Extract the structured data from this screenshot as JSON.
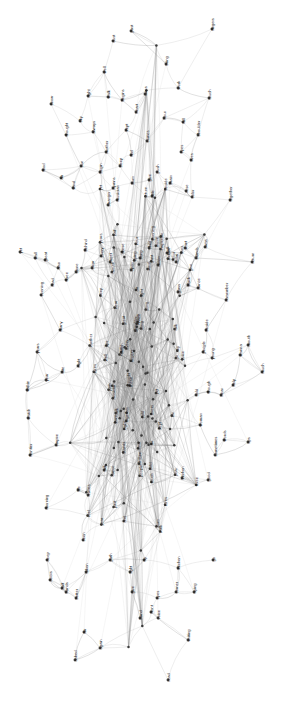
{
  "figure": {
    "background_color": "#ffffff",
    "node_color": "#3a3a3a",
    "edge_color": "#9a9a9a",
    "label_color": "#111111",
    "label_rotation_degrees": -90
  },
  "chart_data": {
    "type": "scatter",
    "subtitle": "",
    "xlabel": "",
    "ylabel": "",
    "xlim": [
      0,
      287
    ],
    "ylim": [
      0,
      716
    ],
    "grid": false,
    "legend": "none",
    "layout": "force-directed",
    "node_count": 261,
    "edge_count": 742,
    "nodes": [
      {
        "label": "past",
        "x": 131,
        "y": 31
      },
      {
        "label": "dust",
        "x": 113,
        "y": 41
      },
      {
        "label": "fingers",
        "x": 212,
        "y": 29
      },
      {
        "label": "bring",
        "x": 166,
        "y": 64
      },
      {
        "label": "well",
        "x": 104,
        "y": 72
      },
      {
        "label": "right",
        "x": 88,
        "y": 96
      },
      {
        "label": "walk",
        "x": 108,
        "y": 97
      },
      {
        "label": "begins",
        "x": 122,
        "y": 100
      },
      {
        "label": "turns",
        "x": 145,
        "y": 94
      },
      {
        "label": "work",
        "x": 178,
        "y": 88
      },
      {
        "label": "touch",
        "x": 209,
        "y": 98
      },
      {
        "label": "snow",
        "x": 51,
        "y": 104
      },
      {
        "label": "sky",
        "x": 80,
        "y": 121
      },
      {
        "label": "heart",
        "x": 136,
        "y": 112
      },
      {
        "label": "hour",
        "x": 164,
        "y": 118
      },
      {
        "label": "fall",
        "x": 183,
        "y": 122
      },
      {
        "label": "thought",
        "x": 66,
        "y": 135
      },
      {
        "label": "always",
        "x": 93,
        "y": 132
      },
      {
        "label": "kept",
        "x": 126,
        "y": 130
      },
      {
        "label": "comes",
        "x": 147,
        "y": 141
      },
      {
        "label": "shoulder",
        "x": 198,
        "y": 135
      },
      {
        "label": "food",
        "x": 43,
        "y": 170
      },
      {
        "label": "air",
        "x": 61,
        "y": 178
      },
      {
        "label": "sun",
        "x": 81,
        "y": 166
      },
      {
        "label": "wind",
        "x": 73,
        "y": 188
      },
      {
        "label": "begin",
        "x": 100,
        "y": 172
      },
      {
        "label": "mother",
        "x": 106,
        "y": 152
      },
      {
        "label": "sleep",
        "x": 120,
        "y": 166
      },
      {
        "label": "feel",
        "x": 131,
        "y": 155
      },
      {
        "label": "eyes",
        "x": 181,
        "y": 152
      },
      {
        "label": "lives",
        "x": 191,
        "y": 160
      },
      {
        "label": "push",
        "x": 157,
        "y": 172
      },
      {
        "label": "burn",
        "x": 132,
        "y": 183
      },
      {
        "label": "hymns",
        "x": 113,
        "y": 188
      },
      {
        "label": "give",
        "x": 149,
        "y": 180
      },
      {
        "label": "brain",
        "x": 170,
        "y": 183
      },
      {
        "label": "together",
        "x": 230,
        "y": 200
      },
      {
        "label": "stranger",
        "x": 108,
        "y": 205
      },
      {
        "label": "musician",
        "x": 117,
        "y": 200
      },
      {
        "label": "little",
        "x": 152,
        "y": 196
      },
      {
        "label": "color",
        "x": 192,
        "y": 197
      },
      {
        "label": "rose",
        "x": 186,
        "y": 191
      },
      {
        "label": "yet",
        "x": 20,
        "y": 252
      },
      {
        "label": "wall",
        "x": 35,
        "y": 258
      },
      {
        "label": "great",
        "x": 45,
        "y": 260
      },
      {
        "label": "also",
        "x": 58,
        "y": 268
      },
      {
        "label": "evening",
        "x": 41,
        "y": 295
      },
      {
        "label": "read",
        "x": 52,
        "y": 285
      },
      {
        "label": "three",
        "x": 66,
        "y": 280
      },
      {
        "label": "stone",
        "x": 76,
        "y": 272
      },
      {
        "label": "behind",
        "x": 85,
        "y": 250
      },
      {
        "label": "clear",
        "x": 92,
        "y": 268
      },
      {
        "label": "every",
        "x": 101,
        "y": 256
      },
      {
        "label": "street",
        "x": 110,
        "y": 262
      },
      {
        "label": "these",
        "x": 122,
        "y": 252
      },
      {
        "label": "open",
        "x": 131,
        "y": 270
      },
      {
        "label": "song",
        "x": 140,
        "y": 258
      },
      {
        "label": "child",
        "x": 149,
        "y": 248
      },
      {
        "label": "moon",
        "x": 158,
        "y": 265
      },
      {
        "label": "dark",
        "x": 167,
        "y": 253
      },
      {
        "label": "room",
        "x": 176,
        "y": 262
      },
      {
        "label": "want",
        "x": 185,
        "y": 248
      },
      {
        "label": "stands",
        "x": 196,
        "y": 258
      },
      {
        "label": "arms",
        "x": 205,
        "y": 247
      },
      {
        "label": "return",
        "x": 252,
        "y": 262
      },
      {
        "label": "remember",
        "x": 226,
        "y": 300
      },
      {
        "label": "mouth",
        "x": 248,
        "y": 345
      },
      {
        "label": "many",
        "x": 60,
        "y": 330
      },
      {
        "label": "years",
        "x": 37,
        "y": 352
      },
      {
        "label": "within",
        "x": 27,
        "y": 390
      },
      {
        "label": "year",
        "x": 46,
        "y": 380
      },
      {
        "label": "late",
        "x": 62,
        "y": 372
      },
      {
        "label": "night",
        "x": 78,
        "y": 366
      },
      {
        "label": "black",
        "x": 188,
        "y": 285
      },
      {
        "label": "dance",
        "x": 198,
        "y": 288
      },
      {
        "label": "glass",
        "x": 178,
        "y": 292
      },
      {
        "label": "beside",
        "x": 206,
        "y": 330
      },
      {
        "label": "young",
        "x": 212,
        "y": 358
      },
      {
        "label": "people",
        "x": 203,
        "y": 352
      },
      {
        "label": "wanna",
        "x": 240,
        "y": 355
      },
      {
        "label": "much",
        "x": 262,
        "y": 372
      },
      {
        "label": "help",
        "x": 233,
        "y": 385
      },
      {
        "label": "hear",
        "x": 221,
        "y": 395
      },
      {
        "label": "though",
        "x": 208,
        "y": 392
      },
      {
        "label": "cold",
        "x": 196,
        "y": 395
      },
      {
        "label": "woman",
        "x": 200,
        "y": 425
      },
      {
        "label": "words",
        "x": 224,
        "y": 440
      },
      {
        "label": "sometimes",
        "x": 215,
        "y": 455
      },
      {
        "label": "lips",
        "x": 248,
        "y": 442
      },
      {
        "label": "good",
        "x": 208,
        "y": 480
      },
      {
        "label": "kitchen",
        "x": 182,
        "y": 478
      },
      {
        "label": "frontier",
        "x": 30,
        "y": 455
      },
      {
        "label": "empire",
        "x": 56,
        "y": 445
      },
      {
        "label": "morning",
        "x": 46,
        "y": 508
      },
      {
        "label": "deep",
        "x": 47,
        "y": 560
      },
      {
        "label": "seen",
        "x": 83,
        "y": 540
      },
      {
        "label": "life",
        "x": 78,
        "y": 490
      },
      {
        "label": "leaves",
        "x": 88,
        "y": 495
      },
      {
        "label": "talk",
        "x": 104,
        "y": 470
      },
      {
        "label": "watch",
        "x": 28,
        "y": 418
      },
      {
        "label": "path",
        "x": 110,
        "y": 560
      },
      {
        "label": "taken",
        "x": 86,
        "y": 572
      },
      {
        "label": "half",
        "x": 62,
        "y": 588
      },
      {
        "label": "better",
        "x": 76,
        "y": 598
      },
      {
        "label": "doors",
        "x": 50,
        "y": 580
      },
      {
        "label": "hands",
        "x": 66,
        "y": 592
      },
      {
        "label": "far",
        "x": 84,
        "y": 632
      },
      {
        "label": "again",
        "x": 100,
        "y": 648
      },
      {
        "label": "light",
        "x": 130,
        "y": 572
      },
      {
        "label": "give2",
        "x": 132,
        "y": 592
      },
      {
        "label": "hand",
        "x": 140,
        "y": 618
      },
      {
        "label": "front",
        "x": 151,
        "y": 612
      },
      {
        "label": "try",
        "x": 144,
        "y": 560
      },
      {
        "label": "eyes2",
        "x": 157,
        "y": 598
      },
      {
        "label": "voice",
        "x": 158,
        "y": 618
      },
      {
        "label": "corner",
        "x": 176,
        "y": 592
      },
      {
        "label": "kitchen2",
        "x": 178,
        "y": 568
      },
      {
        "label": "trying",
        "x": 194,
        "y": 592
      },
      {
        "label": "writing",
        "x": 188,
        "y": 640
      },
      {
        "label": "read2",
        "x": 168,
        "y": 680
      },
      {
        "label": "go",
        "x": 213,
        "y": 560
      },
      {
        "label": "asked",
        "x": 75,
        "y": 660
      }
    ],
    "node_labels_visible": [
      "past",
      "dust",
      "fingers",
      "bring",
      "well",
      "right",
      "walk",
      "begins",
      "turns",
      "work",
      "touch",
      "snow",
      "sky",
      "heart",
      "hour",
      "fall",
      "thought",
      "always",
      "kept",
      "comes",
      "shoulder",
      "food",
      "air",
      "sun",
      "wind",
      "begin",
      "mother",
      "sleep",
      "feel",
      "eyes",
      "lives",
      "push",
      "burn",
      "hymns",
      "give",
      "brain",
      "together",
      "stranger",
      "musician",
      "little",
      "color",
      "rose",
      "yet",
      "wall",
      "great",
      "also",
      "evening",
      "read",
      "three",
      "stone",
      "behind",
      "clear",
      "every",
      "street",
      "these",
      "open",
      "song",
      "child",
      "moon",
      "dark",
      "room",
      "want",
      "stands",
      "arms",
      "return",
      "remember",
      "mouth",
      "many",
      "years",
      "within",
      "year",
      "late",
      "night",
      "black",
      "dance",
      "glass",
      "beside",
      "young",
      "people",
      "wanna",
      "much",
      "help",
      "hear",
      "though",
      "cold",
      "woman",
      "words",
      "sometimes",
      "lips",
      "good",
      "kitchen",
      "frontier",
      "empire",
      "morning",
      "deep",
      "seen",
      "life",
      "leaves",
      "talk",
      "watch",
      "path",
      "taken",
      "half",
      "better",
      "doors",
      "hands",
      "far",
      "again",
      "light",
      "hand",
      "front",
      "try",
      "voice",
      "corner",
      "trying",
      "writing",
      "go",
      "asked"
    ]
  }
}
